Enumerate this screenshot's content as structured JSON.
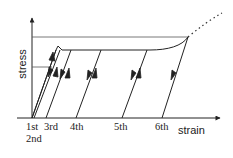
{
  "diagram": {
    "type": "stress-strain diagram with cyclic unloading/reloading",
    "axes": {
      "y_label": "stress",
      "x_label": "strain"
    },
    "cycle_labels": [
      "1st",
      "2nd",
      "3rd",
      "4th",
      "5th",
      "6th"
    ],
    "colors": {
      "line": "#222222",
      "reference_line": "#555555",
      "background": "#ffffff"
    }
  }
}
